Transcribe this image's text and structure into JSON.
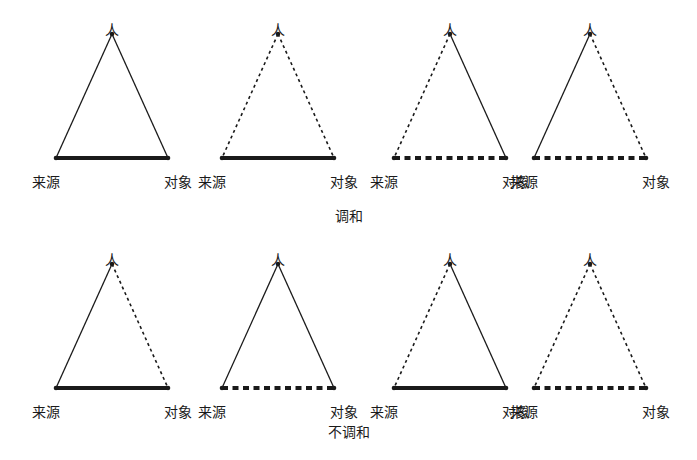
{
  "figure": {
    "background_color": "#ffffff",
    "ink_color": "#1a1a1a",
    "apex_label": "人",
    "base_left_label": "来源",
    "base_right_label": "对象"
  },
  "rows": [
    {
      "id": "harmony",
      "caption": "调和",
      "triads": [
        {
          "id": "harmony-1",
          "apex_label": "人",
          "base_left_label": "来源",
          "base_right_label": "对象",
          "left_edge_style": "solid",
          "right_edge_style": "solid",
          "base_edge_style": "solid"
        },
        {
          "id": "harmony-2",
          "apex_label": "人",
          "base_left_label": "来源",
          "base_right_label": "对象",
          "left_edge_style": "dashed",
          "right_edge_style": "dashed",
          "base_edge_style": "solid"
        },
        {
          "id": "harmony-3",
          "apex_label": "人",
          "base_left_label": "来源",
          "base_right_label": "对象",
          "left_edge_style": "dashed",
          "right_edge_style": "solid",
          "base_edge_style": "dashed"
        },
        {
          "id": "harmony-4",
          "apex_label": "人",
          "base_left_label": "来源",
          "base_right_label": "对象",
          "left_edge_style": "solid",
          "right_edge_style": "dashed",
          "base_edge_style": "dashed"
        }
      ]
    },
    {
      "id": "disharmony",
      "caption": "不调和",
      "triads": [
        {
          "id": "disharmony-1",
          "apex_label": "人",
          "base_left_label": "来源",
          "base_right_label": "对象",
          "left_edge_style": "solid",
          "right_edge_style": "dashed",
          "base_edge_style": "solid"
        },
        {
          "id": "disharmony-2",
          "apex_label": "人",
          "base_left_label": "来源",
          "base_right_label": "对象",
          "left_edge_style": "solid",
          "right_edge_style": "solid",
          "base_edge_style": "dashed"
        },
        {
          "id": "disharmony-3",
          "apex_label": "人",
          "base_left_label": "来源",
          "base_right_label": "对象",
          "left_edge_style": "dashed",
          "right_edge_style": "solid",
          "base_edge_style": "solid"
        },
        {
          "id": "disharmony-4",
          "apex_label": "人",
          "base_left_label": "来源",
          "base_right_label": "对象",
          "left_edge_style": "dashed",
          "right_edge_style": "dashed",
          "base_edge_style": "dashed"
        }
      ]
    }
  ],
  "layout": {
    "triad_left_offsets": [
      32,
      198,
      370,
      510
    ],
    "apex_x": [
      80,
      55,
      75,
      55
    ]
  }
}
